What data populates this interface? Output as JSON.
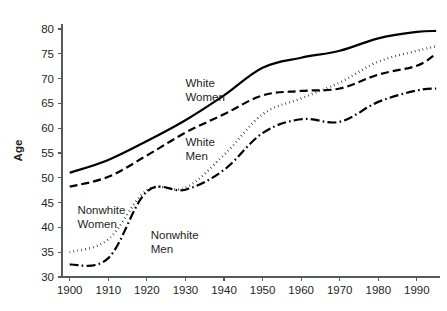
{
  "chart_data": {
    "type": "line",
    "title": "",
    "subtitle": "",
    "xlabel": "",
    "ylabel": "Age",
    "xlim": [
      1898,
      1996
    ],
    "ylim": [
      30,
      81
    ],
    "grid": false,
    "legend_position": "inline-annotations",
    "x_ticks": [
      1900,
      1910,
      1920,
      1930,
      1940,
      1950,
      1960,
      1970,
      1980,
      1990
    ],
    "x_tick_labels": [
      "1900",
      "1910",
      "1920",
      "1930",
      "1940",
      "1950",
      "1960",
      "1970",
      "1980",
      "1990"
    ],
    "y_ticks": [
      30,
      35,
      40,
      45,
      50,
      55,
      60,
      65,
      70,
      75,
      80
    ],
    "y_tick_labels": [
      "30",
      "35",
      "40",
      "45",
      "50",
      "55",
      "60",
      "65",
      "70",
      "75",
      "80"
    ],
    "x": [
      1900,
      1910,
      1920,
      1930,
      1940,
      1950,
      1960,
      1970,
      1980,
      1990,
      1995
    ],
    "series": [
      {
        "name": "White Women",
        "label": "White",
        "label_line2": "Women",
        "style": "solid",
        "color": "#000000",
        "width": 2.2,
        "dash": "",
        "label_x": 1930,
        "label_y": 68.2,
        "values": [
          51.0,
          53.6,
          57.4,
          61.6,
          66.6,
          72.2,
          74.2,
          75.6,
          78.1,
          79.4,
          79.6
        ]
      },
      {
        "name": "White Men",
        "label": "White",
        "label_line2": "Men",
        "style": "dashed",
        "color": "#000000",
        "width": 2.2,
        "dash": "8,4",
        "label_x": 1930,
        "label_y": 56.4,
        "values": [
          48.2,
          50.2,
          54.5,
          59.1,
          62.8,
          66.6,
          67.5,
          68.0,
          70.8,
          72.6,
          75.0
        ]
      },
      {
        "name": "Nonwhite Women",
        "label": "Nonwhite",
        "label_line2": "Women",
        "style": "dotted",
        "color": "#000000",
        "width": 2.4,
        "dash": "0.6,3.4",
        "label_x": 1902,
        "label_y": 42.8,
        "values": [
          35.0,
          37.6,
          47.5,
          48.0,
          54.6,
          62.8,
          66.0,
          69.2,
          73.4,
          75.6,
          76.5
        ]
      },
      {
        "name": "Nonwhite Men",
        "label": "Nonwhite",
        "label_line2": "Men",
        "style": "dash-dot",
        "color": "#000000",
        "width": 2.2,
        "dash": "9,3.2,1.6,3.2",
        "label_x": 1921,
        "label_y": 37.6,
        "values": [
          32.5,
          33.8,
          47.2,
          47.6,
          51.6,
          59.0,
          61.8,
          61.3,
          65.3,
          67.6,
          68.0
        ]
      }
    ]
  },
  "plot_geometry": {
    "left": 62,
    "right": 440,
    "top": 24,
    "bottom": 277,
    "tick_length": 4
  }
}
